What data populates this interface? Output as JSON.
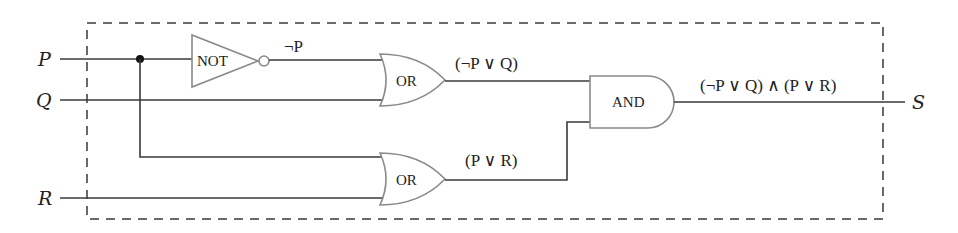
{
  "diagram": {
    "type": "logic-circuit",
    "inputs": [
      {
        "id": "P",
        "label": "P"
      },
      {
        "id": "Q",
        "label": "Q"
      },
      {
        "id": "R",
        "label": "R"
      }
    ],
    "output": {
      "id": "S",
      "label": "S"
    },
    "gates": {
      "not": {
        "label": "NOT",
        "output_label": "¬P"
      },
      "or_top": {
        "label": "OR",
        "output_label": "(¬P ∨ Q)"
      },
      "or_bottom": {
        "label": "OR",
        "output_label": "(P ∨ R)"
      },
      "and": {
        "label": "AND",
        "output_label": "(¬P ∨ Q) ∧ (P ∨ R)"
      }
    },
    "colors": {
      "wire": "#3a3a3a",
      "gate_outline": "#8a8a8a",
      "text": "#222222",
      "background": "#ffffff"
    }
  }
}
